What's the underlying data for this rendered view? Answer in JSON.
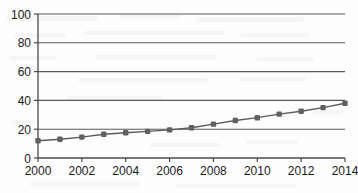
{
  "chart_data": {
    "type": "line",
    "title": "",
    "subtitle": "",
    "xlabel": "",
    "ylabel": "",
    "x": [
      2000,
      2001,
      2002,
      2003,
      2004,
      2005,
      2006,
      2007,
      2008,
      2009,
      2010,
      2011,
      2012,
      2013,
      2014
    ],
    "values": [
      12,
      13,
      14.5,
      16.5,
      17.5,
      18.5,
      19.5,
      21,
      23.5,
      26,
      28,
      30.5,
      32.5,
      35,
      38
    ],
    "series": [
      {
        "name": "series-1",
        "values": [
          12,
          13,
          14.5,
          16.5,
          17.5,
          18.5,
          19.5,
          21,
          23.5,
          26,
          28,
          30.5,
          32.5,
          35,
          38
        ]
      }
    ],
    "xlim": [
      2000,
      2014
    ],
    "ylim": [
      0,
      100
    ],
    "ytick_labels": [
      "0",
      "20",
      "40",
      "60",
      "80",
      "100"
    ],
    "ytick_values": [
      0,
      20,
      40,
      60,
      80,
      100
    ],
    "xtick_labels": [
      "2000",
      "2002",
      "2004",
      "2006",
      "2008",
      "2010",
      "2012",
      "2014"
    ],
    "xtick_values": [
      2000,
      2002,
      2004,
      2006,
      2008,
      2010,
      2012,
      2014
    ],
    "grid": "horizontal",
    "legend": "none",
    "marker": "square",
    "colors": {
      "line": "#5a5a5a",
      "marker": "#606060",
      "axis": "#4a4a4a",
      "grid": "#5a5a5a",
      "text": "#1a1a1a",
      "background": "#fdfdfd"
    }
  }
}
